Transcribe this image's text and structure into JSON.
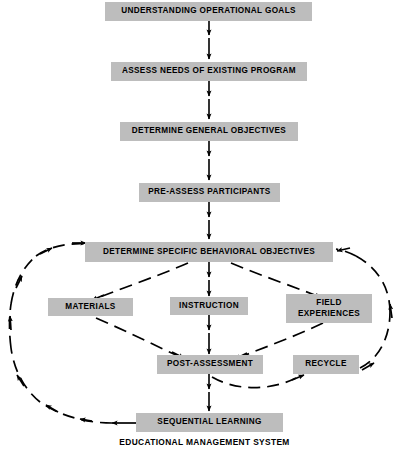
{
  "diagram": {
    "caption": "EDUCATIONAL MANAGEMENT SYSTEM",
    "box_fill": "#bdbdbd",
    "line_color": "#000000",
    "nodes": [
      {
        "id": "understanding-operational-goals",
        "label": "UNDERSTANDING OPERATIONAL GOALS"
      },
      {
        "id": "assess-needs-of-existing-program",
        "label": "ASSESS NEEDS OF EXISTING PROGRAM"
      },
      {
        "id": "determine-general-objectives",
        "label": "DETERMINE GENERAL OBJECTIVES"
      },
      {
        "id": "pre-assess-participants",
        "label": "PRE-ASSESS PARTICIPANTS"
      },
      {
        "id": "determine-specific-behavioral-objectives",
        "label": "DETERMINE SPECIFIC BEHAVIORAL OBJECTIVES"
      },
      {
        "id": "materials",
        "label": "MATERIALS"
      },
      {
        "id": "instruction",
        "label": "INSTRUCTION"
      },
      {
        "id": "field-experiences",
        "label": "FIELD\nEXPERIENCES"
      },
      {
        "id": "post-assessment",
        "label": "POST-ASSESSMENT"
      },
      {
        "id": "recycle",
        "label": "RECYCLE"
      },
      {
        "id": "sequential-learning",
        "label": "SEQUENTIAL LEARNING"
      }
    ],
    "edges": [
      {
        "from": "understanding-operational-goals",
        "to": "assess-needs-of-existing-program",
        "style": "solid"
      },
      {
        "from": "assess-needs-of-existing-program",
        "to": "determine-general-objectives",
        "style": "solid"
      },
      {
        "from": "determine-general-objectives",
        "to": "pre-assess-participants",
        "style": "solid"
      },
      {
        "from": "pre-assess-participants",
        "to": "determine-specific-behavioral-objectives",
        "style": "solid"
      },
      {
        "from": "determine-specific-behavioral-objectives",
        "to": "instruction",
        "style": "solid"
      },
      {
        "from": "instruction",
        "to": "post-assessment",
        "style": "solid"
      },
      {
        "from": "post-assessment",
        "to": "sequential-learning",
        "style": "solid"
      },
      {
        "from": "determine-specific-behavioral-objectives",
        "to": "materials",
        "style": "dashed"
      },
      {
        "from": "determine-specific-behavioral-objectives",
        "to": "field-experiences",
        "style": "dashed"
      },
      {
        "from": "materials",
        "to": "post-assessment",
        "style": "dashed"
      },
      {
        "from": "field-experiences",
        "to": "post-assessment",
        "style": "dashed"
      },
      {
        "from": "post-assessment",
        "to": "recycle",
        "style": "dashed"
      },
      {
        "from": "recycle",
        "to": "determine-specific-behavioral-objectives",
        "style": "dashed"
      },
      {
        "from": "sequential-learning",
        "to": "determine-specific-behavioral-objectives",
        "style": "dashed"
      }
    ]
  }
}
